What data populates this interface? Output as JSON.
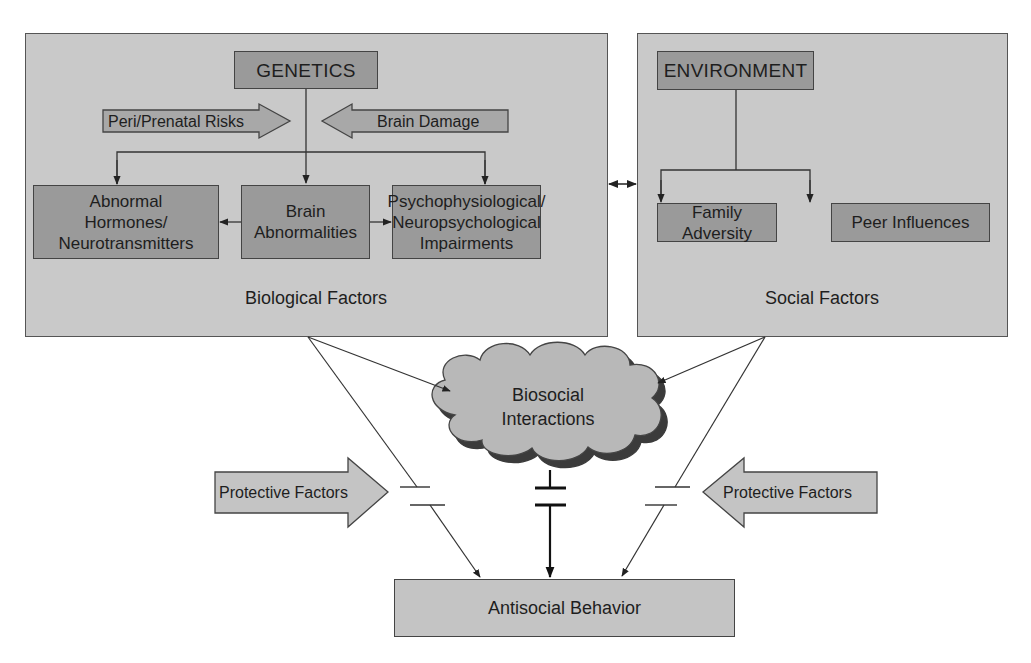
{
  "diagram": {
    "biological_panel": {
      "label": "Biological Factors",
      "genetics": "GENETICS",
      "inputs": {
        "left": "Peri/Prenatal Risks",
        "right": "Brain Damage"
      },
      "children": [
        {
          "label": "Abnormal\nHormones/\nNeurotransmitters"
        },
        {
          "label": "Brain\nAbnormalities"
        },
        {
          "label": "Psychophysiological/\nNeuropsychological\nImpairments"
        }
      ]
    },
    "social_panel": {
      "label": "Social Factors",
      "environment": "ENVIRONMENT",
      "children": [
        {
          "label": "Family Adversity"
        },
        {
          "label": "Peer Influences"
        }
      ]
    },
    "interaction": {
      "label": "Biosocial\nInteractions"
    },
    "protective_factors": {
      "left": "Protective Factors",
      "right": "Protective Factors"
    },
    "outcome": {
      "label": "Antisocial Behavior"
    },
    "colors": {
      "panel_fill": "#c9c9c9",
      "box_dark_fill": "#9a9a9a",
      "box_light_fill": "#c4c4c4",
      "line": "#333333",
      "background": "#ffffff"
    }
  }
}
